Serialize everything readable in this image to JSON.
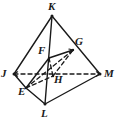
{
  "figure": {
    "name": "triangular-pyramid-jklm",
    "type": "geometry-diagram",
    "canvas": {
      "width": 119,
      "height": 124
    },
    "style": {
      "background_color": "#ffffff",
      "stroke_color": "#1a1a1a",
      "label_color": "#1a1a1a",
      "solid_stroke_width": 1.4,
      "hidden_stroke_width": 1.3,
      "hidden_dash_pattern": "4,3"
    },
    "points": [
      {
        "id": "K",
        "label": "K",
        "x": 52,
        "y": 16,
        "label_x": 48,
        "label_y": 1,
        "kind": "apex"
      },
      {
        "id": "J",
        "label": "J",
        "x": 14,
        "y": 74,
        "label_x": 1,
        "label_y": 68,
        "kind": "base-vertex"
      },
      {
        "id": "M",
        "label": "M",
        "x": 100,
        "y": 74,
        "label_x": 104,
        "label_y": 68,
        "kind": "base-vertex"
      },
      {
        "id": "L",
        "label": "L",
        "x": 45,
        "y": 104,
        "label_x": 41,
        "label_y": 108,
        "kind": "base-vertex"
      },
      {
        "id": "E",
        "label": "E",
        "x": 26,
        "y": 88,
        "label_x": 18,
        "label_y": 86,
        "kind": "midpoint"
      },
      {
        "id": "F",
        "label": "F",
        "x": 49,
        "y": 58,
        "label_x": 38,
        "label_y": 45,
        "kind": "midpoint"
      },
      {
        "id": "G",
        "label": "G",
        "x": 73,
        "y": 50,
        "label_x": 75,
        "label_y": 36,
        "kind": "midpoint"
      },
      {
        "id": "H",
        "label": "H",
        "x": 53,
        "y": 76,
        "label_x": 54,
        "label_y": 74,
        "kind": "midpoint"
      }
    ],
    "solid_edges": [
      {
        "name": "edge-J-K",
        "from": "J",
        "to": "K"
      },
      {
        "name": "edge-K-M",
        "from": "K",
        "to": "M"
      },
      {
        "name": "edge-K-L",
        "from": "K",
        "to": "L"
      },
      {
        "name": "edge-J-E",
        "from": "J",
        "to": "E"
      },
      {
        "name": "edge-E-L",
        "from": "E",
        "to": "L"
      },
      {
        "name": "edge-L-M",
        "from": "L",
        "to": "M"
      },
      {
        "name": "edge-F-G",
        "from": "F",
        "to": "G"
      },
      {
        "name": "edge-E-F",
        "from": "E",
        "to": "F"
      }
    ],
    "hidden_edges": [
      {
        "name": "edge-J-M-hidden",
        "from": "J",
        "to": "M"
      },
      {
        "name": "edge-E-G-hidden",
        "from": "E",
        "to": "G"
      },
      {
        "name": "edge-F-H-hidden",
        "from": "F",
        "to": "H"
      },
      {
        "name": "edge-H-G-hidden",
        "from": "H",
        "to": "G"
      },
      {
        "name": "edge-E-H-hidden",
        "from": "E",
        "to": "H"
      }
    ],
    "arrowheads": [
      {
        "name": "arrowhead-at-G",
        "x": 73,
        "y": 50,
        "angle_deg": -18
      },
      {
        "name": "arrowhead-at-M",
        "x": 100,
        "y": 74,
        "angle_deg": 0
      },
      {
        "name": "arrowhead-at-J",
        "x": 14,
        "y": 74,
        "angle_deg": 180
      }
    ]
  }
}
